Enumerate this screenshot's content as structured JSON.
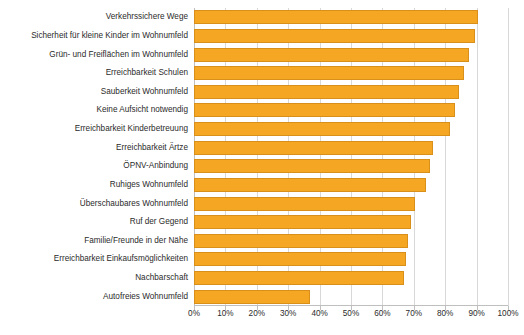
{
  "chart_data": {
    "type": "bar",
    "orientation": "horizontal",
    "title": "",
    "subtitle": "",
    "xlabel": "",
    "ylabel": "",
    "xlim": [
      0,
      100
    ],
    "xtick_labels": [
      "0%",
      "10%",
      "20%",
      "30%",
      "40%",
      "50%",
      "60%",
      "70%",
      "80%",
      "90%",
      "100%"
    ],
    "xticks": [
      0,
      10,
      20,
      30,
      40,
      50,
      60,
      70,
      80,
      90,
      100
    ],
    "grid": true,
    "legend": "none",
    "bar_color": "#f5a623",
    "bar_border_color": "#d9901a",
    "gridline_color": "#d8d8d8",
    "axis_color": "#bfbfbf",
    "text_color": "#2b2b2b",
    "categories": [
      "Verkehrssichere Wege",
      "Sicherheit für kleine Kinder im Wohnumfeld",
      "Grün- und Freiflächen im Wohnumfeld",
      "Erreichbarkeit Schulen",
      "Sauberkeit Wohnumfeld",
      "Keine Aufsicht notwendig",
      "Erreichbarkeit Kinderbetreuung",
      "Erreichbarkeit Ärtze",
      "ÖPNV-Anbindung",
      "Ruhiges Wohnumfeld",
      "Überschaubares Wohnumfeld",
      "Ruf der Gegend",
      "Familie/Freunde in der Nähe",
      "Erreichbarkeit Einkaufsmöglichkeiten",
      "Nachbarschaft",
      "Autofreies Wohnumfeld"
    ],
    "values": [
      90.5,
      89.5,
      87.5,
      86.0,
      84.5,
      83.0,
      81.5,
      76.0,
      75.0,
      74.0,
      70.5,
      69.0,
      68.0,
      67.5,
      67.0,
      37.0
    ]
  }
}
